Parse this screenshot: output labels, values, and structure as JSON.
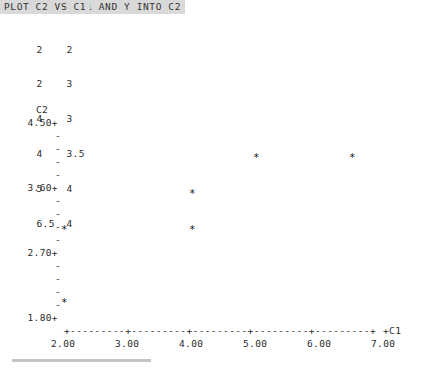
{
  "session": {
    "commands": [
      {
        "id": "read",
        "text": "READ X INTO C1 AND Y INTO C2"
      },
      {
        "id": "plot",
        "text": "PLOT C2 VS C1"
      }
    ],
    "band_color": "#d9d9d9"
  },
  "data_table": {
    "rows": [
      {
        "x": "2",
        "y": "2"
      },
      {
        "x": "2",
        "y": "3"
      },
      {
        "x": "4",
        "y": "3"
      },
      {
        "x": "4",
        "y": "3.5"
      },
      {
        "x": "5",
        "y": "4"
      },
      {
        "x": "6.5",
        "y": "4"
      }
    ]
  },
  "chart_data": {
    "type": "scatter",
    "title": "",
    "ylabel": "C2",
    "xlabel": "C1",
    "x_axis_end_label": "+C1",
    "xlim": [
      2.0,
      7.0
    ],
    "ylim": [
      1.8,
      4.5
    ],
    "x_tick_labels": [
      "2.00",
      "3.00",
      "4.00",
      "5.00",
      "6.00",
      "7.00"
    ],
    "x_tick_values": [
      2.0,
      3.0,
      4.0,
      5.0,
      6.0,
      7.0
    ],
    "y_tick_labels": [
      "4.50+",
      "3.60+",
      "2.70+",
      "1.80+"
    ],
    "y_tick_values": [
      4.5,
      3.6,
      2.7,
      1.8
    ],
    "y_minor_tick_glyph": "-",
    "y_minor_ticks_between_majors": 4,
    "axis_glyph_row": "+---------+---------+---------+---------+---------+",
    "point_marker": "*",
    "grid": false,
    "legend": null,
    "points": [
      {
        "x": 2.0,
        "y": 2.0,
        "marker": "*"
      },
      {
        "x": 2.0,
        "y": 3.0,
        "marker": "*"
      },
      {
        "x": 4.0,
        "y": 3.0,
        "marker": "*"
      },
      {
        "x": 4.0,
        "y": 3.5,
        "marker": "*"
      },
      {
        "x": 5.0,
        "y": 4.0,
        "marker": "*"
      },
      {
        "x": 6.5,
        "y": 4.0,
        "marker": "*"
      }
    ]
  }
}
